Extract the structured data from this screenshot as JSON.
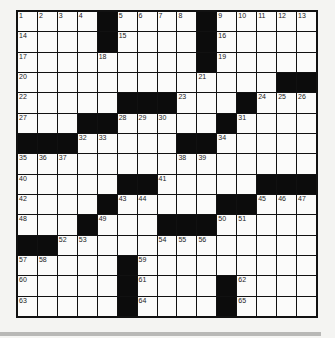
{
  "puzzle": {
    "rows": 15,
    "cols": 15,
    "grid": [
      [
        "1",
        "2",
        "3",
        "4",
        "#",
        "5",
        "6",
        "7",
        "8",
        "#",
        "9",
        "10",
        "11",
        "12",
        "13"
      ],
      [
        "14",
        "",
        "",
        "",
        "#",
        "15",
        "",
        "",
        "",
        "#",
        "16",
        "",
        "",
        "",
        ""
      ],
      [
        "17",
        "",
        "",
        "",
        "18",
        "",
        "",
        "",
        "",
        "#",
        "19",
        "",
        "",
        "",
        ""
      ],
      [
        "20",
        "",
        "",
        "",
        "",
        "",
        "",
        "",
        "",
        "21",
        "",
        "",
        "",
        "#",
        "#"
      ],
      [
        "22",
        "",
        "",
        "",
        "",
        "#",
        "#",
        "#",
        "23",
        "",
        "",
        "#",
        "24",
        "25",
        "26"
      ],
      [
        "27",
        "",
        "",
        "#",
        "#",
        "28",
        "29",
        "30",
        "",
        "",
        "#",
        "31",
        "",
        "",
        ""
      ],
      [
        "#",
        "#",
        "#",
        "32",
        "33",
        "",
        "",
        "",
        "#",
        "#",
        "34",
        "",
        "",
        "",
        ""
      ],
      [
        "35",
        "36",
        "37",
        "",
        "",
        "",
        "",
        "",
        "38",
        "39",
        "",
        "",
        "",
        "",
        ""
      ],
      [
        "40",
        "",
        "",
        "",
        "",
        "#",
        "#",
        "41",
        "",
        "",
        "",
        "",
        "#",
        "#",
        "#"
      ],
      [
        "42",
        "",
        "",
        "",
        "#",
        "43",
        "44",
        "",
        "",
        "",
        "#",
        "#",
        "45",
        "46",
        "47"
      ],
      [
        "48",
        "",
        "",
        "#",
        "49",
        "",
        "",
        "#",
        "#",
        "#",
        "50",
        "51",
        "",
        "",
        ""
      ],
      [
        "#",
        "#",
        "52",
        "53",
        "",
        "",
        "",
        "54",
        "55",
        "56",
        "",
        "",
        "",
        "",
        ""
      ],
      [
        "57",
        "58",
        "",
        "",
        "",
        "#",
        "59",
        "",
        "",
        "",
        "",
        "",
        "",
        "",
        ""
      ],
      [
        "60",
        "",
        "",
        "",
        "",
        "#",
        "61",
        "",
        "",
        "",
        "#",
        "62",
        "",
        "",
        ""
      ],
      [
        "63",
        "",
        "",
        "",
        "",
        "#",
        "64",
        "",
        "",
        "",
        "#",
        "65",
        "",
        "",
        ""
      ]
    ]
  },
  "colors": {
    "block": "#0c0c0c",
    "cell": "#fbfbfa",
    "border": "#111111",
    "background": "#f4f4f2"
  }
}
